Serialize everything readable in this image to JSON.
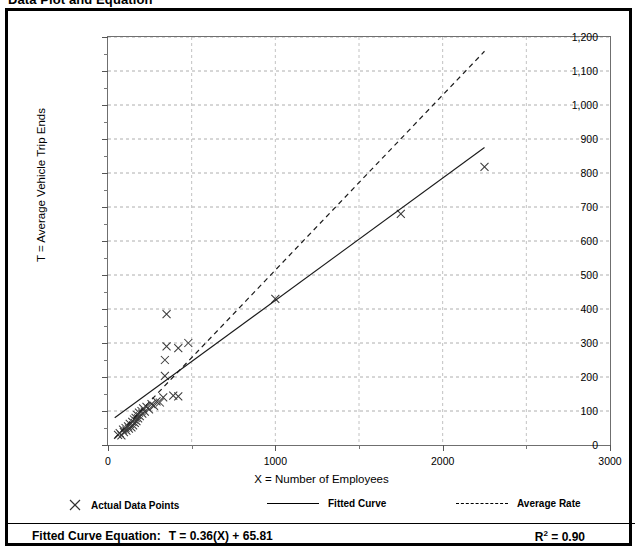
{
  "figure": {
    "title": "Data Plot and Equation"
  },
  "legend": {
    "items": [
      {
        "label": "Actual Data Points",
        "marker": "x-marker-icon"
      },
      {
        "label": "Fitted Curve",
        "marker": "solid-line-icon"
      },
      {
        "label": "Average Rate",
        "marker": "dashed-line-icon"
      }
    ]
  },
  "equation": {
    "label": "Fitted Curve Equation:",
    "expression": "T = 0.36(X) + 65.81",
    "r_squared_prefix": "R",
    "r_squared_exponent": "2",
    "r_squared_value": " = 0.90"
  },
  "chart_data": {
    "type": "scatter",
    "title": "Data Plot and Equation",
    "xlabel": "X = Number of Employees",
    "ylabel": "T = Average Vehicle Trip Ends",
    "xlim": [
      0,
      3000
    ],
    "ylim": [
      0,
      1200
    ],
    "xticks": [
      0,
      1000,
      2000,
      3000
    ],
    "xticks_minor": [
      500,
      1500,
      2500
    ],
    "yticks": [
      0,
      100,
      200,
      300,
      400,
      500,
      600,
      700,
      800,
      900,
      1000,
      1100,
      1200
    ],
    "xtick_labels": [
      "0",
      "1000",
      "2000",
      "3000"
    ],
    "ytick_labels": [
      "0",
      "100",
      "200",
      "300",
      "400",
      "500",
      "600",
      "700",
      "800",
      "900",
      "1,000",
      "1,100",
      "1,200"
    ],
    "grid": "dashed-gray-horizontal-and-vertical",
    "legend_position": "below-axes",
    "series": [
      {
        "name": "Actual Data Points",
        "type": "scatter",
        "marker": "x",
        "points": [
          [
            60,
            30
          ],
          [
            70,
            35
          ],
          [
            80,
            28
          ],
          [
            90,
            45
          ],
          [
            95,
            38
          ],
          [
            105,
            50
          ],
          [
            110,
            42
          ],
          [
            120,
            55
          ],
          [
            125,
            48
          ],
          [
            130,
            62
          ],
          [
            140,
            52
          ],
          [
            145,
            68
          ],
          [
            150,
            58
          ],
          [
            155,
            75
          ],
          [
            160,
            65
          ],
          [
            165,
            80
          ],
          [
            170,
            70
          ],
          [
            175,
            88
          ],
          [
            180,
            78
          ],
          [
            185,
            95
          ],
          [
            190,
            85
          ],
          [
            200,
            100
          ],
          [
            205,
            92
          ],
          [
            210,
            108
          ],
          [
            220,
            98
          ],
          [
            230,
            112
          ],
          [
            245,
            105
          ],
          [
            260,
            120
          ],
          [
            275,
            115
          ],
          [
            290,
            128
          ],
          [
            310,
            125
          ],
          [
            330,
            140
          ],
          [
            340,
            203
          ],
          [
            340,
            250
          ],
          [
            350,
            290
          ],
          [
            350,
            385
          ],
          [
            390,
            145
          ],
          [
            420,
            143
          ],
          [
            420,
            285
          ],
          [
            480,
            300
          ],
          [
            1000,
            430
          ],
          [
            1750,
            680
          ],
          [
            2250,
            818
          ]
        ]
      },
      {
        "name": "Fitted Curve",
        "type": "line",
        "style": "solid",
        "slope": 0.36,
        "intercept": 65.81,
        "endpoints": [
          [
            40,
            80
          ],
          [
            2250,
            875
          ]
        ]
      },
      {
        "name": "Average Rate",
        "type": "line",
        "style": "dashed",
        "slope": 0.515,
        "intercept": 0,
        "endpoints": [
          [
            40,
            20
          ],
          [
            2250,
            1158
          ]
        ]
      }
    ]
  }
}
